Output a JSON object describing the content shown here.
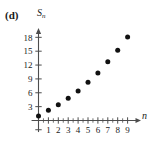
{
  "panel": {
    "label": "(d)"
  },
  "axes": {
    "y_label": "S",
    "y_label_sub": "n",
    "x_label": "n"
  },
  "chart_data": {
    "type": "scatter",
    "title": "",
    "xlabel": "n",
    "ylabel": "S_n",
    "x": [
      0,
      1,
      2,
      3,
      4,
      5,
      6,
      7,
      8,
      9
    ],
    "values": [
      1.0,
      2.2,
      3.4,
      4.8,
      6.4,
      8.3,
      10.3,
      12.7,
      15.2,
      18.1
    ],
    "xticks": [
      1,
      2,
      3,
      4,
      5,
      6,
      7,
      8,
      9
    ],
    "xtick_labels": [
      "1",
      "2",
      "3",
      "4",
      "5",
      "6",
      "7",
      "8",
      "9"
    ],
    "yticks": [
      3,
      6,
      9,
      12,
      15,
      18
    ],
    "ytick_labels": [
      "3",
      "6",
      "9",
      "12",
      "15",
      "18"
    ],
    "xlim": [
      -0.7,
      10.2
    ],
    "ylim": [
      -2.5,
      19.8
    ],
    "grid": false,
    "legend": null,
    "marker_color": "#111111",
    "axis_color": "#4d4d4d"
  }
}
